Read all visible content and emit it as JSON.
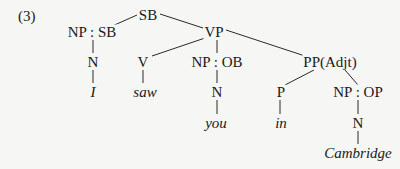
{
  "example_number": "(3)",
  "nodes": {
    "sb": {
      "label": "SB",
      "x": 148,
      "y": 15
    },
    "np_sb": {
      "label": "NP : SB",
      "x": 92,
      "y": 32
    },
    "vp": {
      "label": "VP",
      "x": 214,
      "y": 32
    },
    "n1": {
      "label": "N",
      "x": 93,
      "y": 62
    },
    "v": {
      "label": "V",
      "x": 143,
      "y": 62
    },
    "np_ob": {
      "label": "NP : OB",
      "x": 217,
      "y": 62
    },
    "pp_adjt": {
      "label": "PP(Adjt)",
      "x": 330,
      "y": 62
    },
    "w_i": {
      "label": "I",
      "x": 93,
      "y": 92
    },
    "w_saw": {
      "label": "saw",
      "x": 145,
      "y": 92
    },
    "n2": {
      "label": "N",
      "x": 217,
      "y": 92
    },
    "p": {
      "label": "P",
      "x": 281,
      "y": 92
    },
    "np_op": {
      "label": "NP : OP",
      "x": 358,
      "y": 92
    },
    "w_you": {
      "label": "you",
      "x": 216,
      "y": 123
    },
    "w_in": {
      "label": "in",
      "x": 281,
      "y": 123
    },
    "n3": {
      "label": "N",
      "x": 358,
      "y": 123
    },
    "w_cambridge": {
      "label": "Cambridge",
      "x": 358,
      "y": 153
    }
  },
  "edges": [
    [
      "sb",
      "np_sb"
    ],
    [
      "sb",
      "vp"
    ],
    [
      "np_sb",
      "n1"
    ],
    [
      "n1",
      "w_i"
    ],
    [
      "vp",
      "v"
    ],
    [
      "vp",
      "np_ob"
    ],
    [
      "vp",
      "pp_adjt"
    ],
    [
      "v",
      "w_saw"
    ],
    [
      "np_ob",
      "n2"
    ],
    [
      "n2",
      "w_you"
    ],
    [
      "pp_adjt",
      "p"
    ],
    [
      "pp_adjt",
      "np_op"
    ],
    [
      "p",
      "w_in"
    ],
    [
      "np_op",
      "n3"
    ],
    [
      "n3",
      "w_cambridge"
    ]
  ],
  "colors": {
    "ink": "#1a1a1a",
    "paper": "#f6f6f4"
  }
}
